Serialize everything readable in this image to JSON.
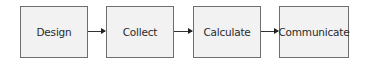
{
  "diagram": {
    "type": "process-flow",
    "steps": [
      {
        "label": "Design"
      },
      {
        "label": "Collect"
      },
      {
        "label": "Calculate"
      },
      {
        "label": "Communicate"
      }
    ],
    "connectors": [
      {
        "from": "Design",
        "to": "Collect"
      },
      {
        "from": "Collect",
        "to": "Calculate"
      },
      {
        "from": "Calculate",
        "to": "Communicate"
      }
    ]
  }
}
